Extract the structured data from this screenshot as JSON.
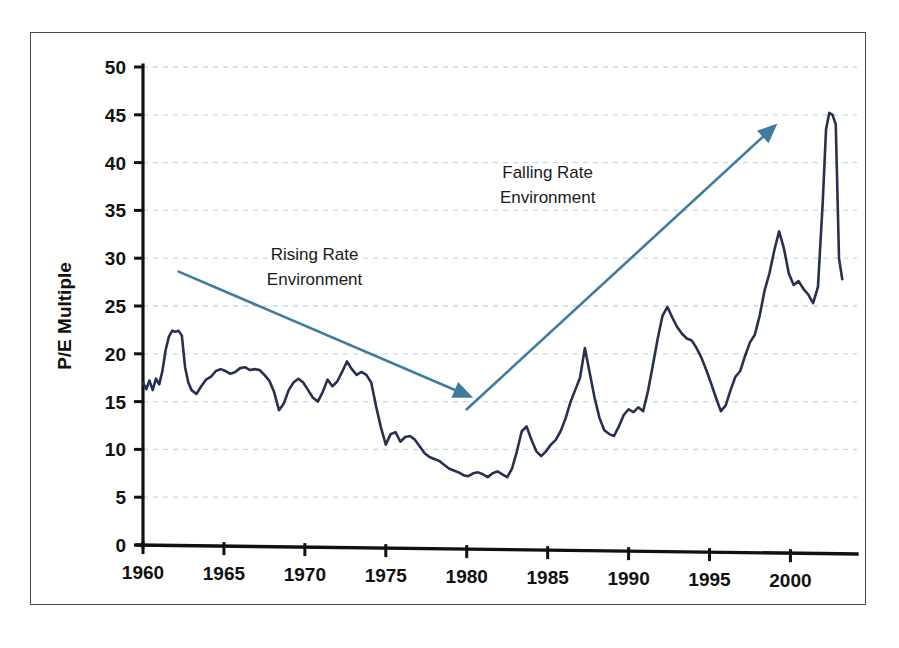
{
  "figure": {
    "cropped_title_fragment": "",
    "frame_color": "#4a4a4a",
    "background": "#ffffff"
  },
  "chart_data": {
    "type": "line",
    "title": "",
    "subtitle": "",
    "xlabel": "",
    "ylabel": "P/E Multiple",
    "xlim": [
      1960,
      2003
    ],
    "ylim": [
      0,
      50
    ],
    "grid": true,
    "grid_style": "dashed",
    "grid_color": "#c9d8e4",
    "legend": false,
    "legend_position": "none",
    "series_color": "#28304f",
    "xticks": [
      "1960",
      "1965",
      "1970",
      "1975",
      "1980",
      "1985",
      "1990",
      "1995",
      "2000"
    ],
    "xtick_values": [
      1960,
      1965,
      1970,
      1975,
      1980,
      1985,
      1990,
      1995,
      2000
    ],
    "yticks": [
      "0",
      "5",
      "10",
      "15",
      "20",
      "25",
      "30",
      "35",
      "40",
      "45",
      "50"
    ],
    "ytick_values": [
      0,
      5,
      10,
      15,
      20,
      25,
      30,
      35,
      40,
      45,
      50
    ],
    "series": [
      {
        "name": "P/E Multiple",
        "x": [
          1960.0,
          1960.2,
          1960.4,
          1960.6,
          1960.8,
          1961.0,
          1961.2,
          1961.4,
          1961.6,
          1961.8,
          1962.0,
          1962.2,
          1962.4,
          1962.6,
          1962.8,
          1963.0,
          1963.3,
          1963.6,
          1963.9,
          1964.2,
          1964.5,
          1964.8,
          1965.1,
          1965.4,
          1965.7,
          1966.0,
          1966.3,
          1966.6,
          1966.9,
          1967.2,
          1967.5,
          1967.8,
          1968.1,
          1968.4,
          1968.7,
          1969.0,
          1969.3,
          1969.6,
          1969.9,
          1970.2,
          1970.5,
          1970.8,
          1971.1,
          1971.4,
          1971.7,
          1972.0,
          1972.3,
          1972.6,
          1972.9,
          1973.2,
          1973.5,
          1973.8,
          1974.1,
          1974.4,
          1974.7,
          1975.0,
          1975.3,
          1975.6,
          1975.9,
          1976.2,
          1976.5,
          1976.8,
          1977.1,
          1977.4,
          1977.7,
          1978.0,
          1978.3,
          1978.6,
          1978.9,
          1979.2,
          1979.5,
          1979.8,
          1980.1,
          1980.4,
          1980.7,
          1981.0,
          1981.3,
          1981.6,
          1981.9,
          1982.2,
          1982.5,
          1982.8,
          1983.1,
          1983.4,
          1983.7,
          1984.0,
          1984.3,
          1984.6,
          1984.9,
          1985.2,
          1985.5,
          1985.8,
          1986.1,
          1986.4,
          1986.7,
          1987.0,
          1987.3,
          1987.6,
          1987.9,
          1988.2,
          1988.5,
          1988.8,
          1989.1,
          1989.4,
          1989.7,
          1990.0,
          1990.3,
          1990.6,
          1990.9,
          1991.2,
          1991.5,
          1991.8,
          1992.1,
          1992.4,
          1992.7,
          1993.0,
          1993.3,
          1993.6,
          1993.9,
          1994.2,
          1994.5,
          1994.8,
          1995.1,
          1995.4,
          1995.7,
          1996.0,
          1996.3,
          1996.6,
          1996.9,
          1997.2,
          1997.5,
          1997.8,
          1998.1,
          1998.4,
          1998.7,
          1999.0,
          1999.3,
          1999.6,
          1999.9,
          2000.2,
          2000.5,
          2000.8,
          2001.1,
          2001.4,
          2001.7,
          2002.0,
          2002.2,
          2002.4,
          2002.6,
          2002.8,
          2003.0,
          2003.2
        ],
        "y": [
          17.0,
          16.3,
          17.2,
          16.2,
          17.4,
          16.8,
          18.2,
          20.4,
          21.8,
          22.4,
          22.3,
          22.4,
          21.9,
          18.6,
          17.0,
          16.2,
          15.8,
          16.6,
          17.3,
          17.6,
          18.2,
          18.4,
          18.2,
          17.9,
          18.1,
          18.5,
          18.6,
          18.3,
          18.4,
          18.3,
          17.8,
          17.2,
          16.0,
          14.1,
          14.8,
          16.2,
          17.0,
          17.4,
          17.0,
          16.2,
          15.4,
          15.0,
          16.0,
          17.3,
          16.6,
          17.1,
          18.1,
          19.2,
          18.4,
          17.8,
          18.1,
          17.8,
          17.0,
          14.5,
          12.3,
          10.5,
          11.6,
          11.8,
          10.8,
          11.3,
          11.4,
          11.0,
          10.3,
          9.6,
          9.2,
          9.0,
          8.8,
          8.4,
          8.0,
          7.8,
          7.6,
          7.3,
          7.2,
          7.5,
          7.6,
          7.4,
          7.1,
          7.5,
          7.7,
          7.4,
          7.1,
          8.0,
          9.8,
          11.9,
          12.4,
          11.0,
          9.8,
          9.3,
          9.8,
          10.5,
          11.0,
          11.9,
          13.2,
          14.9,
          16.2,
          17.5,
          20.6,
          18.0,
          15.4,
          13.3,
          12.0,
          11.6,
          11.4,
          12.4,
          13.6,
          14.2,
          13.9,
          14.4,
          14.0,
          16.1,
          18.8,
          21.6,
          24.0,
          24.9,
          23.8,
          22.8,
          22.1,
          21.6,
          21.4,
          20.6,
          19.6,
          18.3,
          16.9,
          15.4,
          14.0,
          14.6,
          16.2,
          17.6,
          18.2,
          19.8,
          21.2,
          22.0,
          24.0,
          26.6,
          28.4,
          30.8,
          32.8,
          31.0,
          28.4,
          27.2,
          27.6,
          26.8,
          26.2,
          25.3,
          27.0,
          36.0,
          43.5,
          45.2,
          45.0,
          44.0,
          30.0,
          27.8
        ]
      }
    ],
    "annotations": [
      {
        "id": "rising-rate",
        "text_lines": [
          "Rising Rate",
          "Environment"
        ],
        "text_x": 1970.6,
        "text_y": 29.8,
        "arrow": {
          "x1": 1962.2,
          "y1": 28.6,
          "x2": 1980.4,
          "y2": 15.4,
          "color": "#3f7c9e"
        }
      },
      {
        "id": "falling-rate",
        "text_lines": [
          "Falling Rate",
          "Environment"
        ],
        "text_x": 1985.0,
        "text_y": 38.4,
        "arrow": {
          "x1": 1980.0,
          "y1": 14.2,
          "x2": 1999.2,
          "y2": 44.1,
          "color": "#3f7c9e"
        }
      }
    ]
  }
}
